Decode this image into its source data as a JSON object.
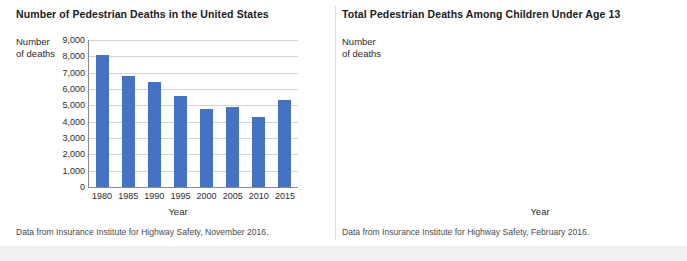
{
  "chart_data": [
    {
      "type": "bar",
      "title": "Number of Pedestrian Deaths in the United States",
      "ylabel": "Number\nof deaths",
      "ylabel_line1": "Number",
      "ylabel_line2": "of deaths",
      "xlabel": "Year",
      "categories": [
        "1980",
        "1985",
        "1990",
        "1995",
        "2000",
        "2005",
        "2010",
        "2015"
      ],
      "values": [
        8100,
        6800,
        6450,
        5550,
        4760,
        4880,
        4300,
        5350
      ],
      "yticks": [
        "9,000",
        "8,000",
        "7,000",
        "6,000",
        "5,000",
        "4,000",
        "3,000",
        "2,000",
        "1,000",
        "0"
      ],
      "ytick_values": [
        9000,
        8000,
        7000,
        6000,
        5000,
        4000,
        3000,
        2000,
        1000,
        0
      ],
      "ylim": [
        0,
        9000
      ],
      "grid": "horizontal",
      "legend": "none",
      "bar_color": "#4472c4",
      "source_note": "Data from Insurance Institute for Highway Safety, November 2016."
    },
    {
      "type": "line",
      "title": "Total Pedestrian Deaths Among Children Under Age 13",
      "ylabel_line1": "Number",
      "ylabel_line2": "of deaths",
      "xlabel": "Year",
      "x": [
        1996,
        1998,
        2000,
        2002,
        2004,
        2006,
        2008,
        2010,
        2012,
        2014
      ],
      "values": [
        575,
        490,
        430,
        362,
        330,
        312,
        280,
        278,
        276,
        256
      ],
      "xticks": [
        "1996",
        "1998",
        "2000",
        "2002",
        "2004",
        "2006",
        "2008",
        "2010",
        "2012",
        "2014"
      ],
      "yticks": [
        "600",
        "500",
        "400",
        "300",
        "200",
        "100",
        "0"
      ],
      "ytick_values": [
        600,
        500,
        400,
        300,
        200,
        100,
        0
      ],
      "ylim": [
        0,
        600
      ],
      "xlim": [
        1995,
        2015
      ],
      "grid": "both",
      "legend": "none",
      "line_color": "#4472c4",
      "source_note": "Data from Insurance Institute for Highway Safety, February 2016."
    }
  ],
  "colors": {
    "series": "#4472c4",
    "grid": "#d3d3d6",
    "axis": "#8a8a8a",
    "text": "#2b2b2b",
    "title": "#1b1b1b"
  }
}
